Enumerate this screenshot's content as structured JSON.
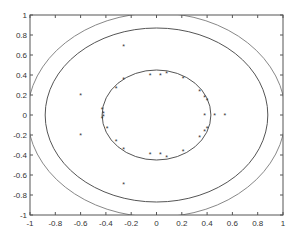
{
  "chart_data": {
    "type": "scatter",
    "title": "",
    "xlabel": "",
    "ylabel": "",
    "xlim": [
      -1,
      1
    ],
    "ylim": [
      -1,
      1
    ],
    "grid": false,
    "legend": null,
    "x_ticks": [
      "-1",
      "-0.8",
      "-0.6",
      "-0.4",
      "-0.2",
      "0",
      "0.2",
      "0.4",
      "0.6",
      "0.8",
      "1"
    ],
    "y_ticks": [
      "1",
      "0.8",
      "0.6",
      "0.4",
      "0.2",
      "0",
      "-0.2",
      "-0.4",
      "-0.6",
      "-0.8",
      "-1"
    ],
    "series": [
      {
        "name": "points",
        "marker": "*",
        "color": "#333333",
        "points": [
          [
            -0.32,
            0.27
          ],
          [
            -0.26,
            0.36
          ],
          [
            -0.05,
            0.4
          ],
          [
            0.03,
            0.4
          ],
          [
            0.08,
            0.42
          ],
          [
            0.21,
            0.37
          ],
          [
            0.34,
            0.24
          ],
          [
            0.38,
            0.18
          ],
          [
            0.4,
            0.15
          ],
          [
            -0.43,
            0.06
          ],
          [
            -0.42,
            0.02
          ],
          [
            -0.42,
            -0.01
          ],
          [
            -0.43,
            -0.03
          ],
          [
            -0.39,
            -0.13
          ],
          [
            0.38,
            0.0
          ],
          [
            0.46,
            0.0
          ],
          [
            0.54,
            0.0
          ],
          [
            -0.32,
            -0.26
          ],
          [
            -0.26,
            -0.34
          ],
          [
            -0.05,
            -0.39
          ],
          [
            0.03,
            -0.39
          ],
          [
            0.08,
            -0.42
          ],
          [
            0.21,
            -0.36
          ],
          [
            0.34,
            -0.22
          ],
          [
            0.38,
            -0.16
          ],
          [
            0.4,
            -0.13
          ],
          [
            -0.6,
            0.2
          ],
          [
            -0.6,
            -0.2
          ],
          [
            -0.26,
            0.69
          ],
          [
            -0.26,
            -0.69
          ]
        ]
      }
    ],
    "contours": [
      {
        "name": "inner-ellipse",
        "cx": 0.0,
        "cy": 0.0,
        "rx": 0.43,
        "ry": 0.45,
        "color": "#555555"
      },
      {
        "name": "middle-ellipse",
        "cx": 0.0,
        "cy": 0.0,
        "rx": 0.88,
        "ry": 0.87,
        "color": "#555555"
      },
      {
        "name": "outer-ellipse",
        "cx": 0.0,
        "cy": 0.0,
        "rx": 1.02,
        "ry": 1.02,
        "color": "#888888"
      }
    ]
  }
}
